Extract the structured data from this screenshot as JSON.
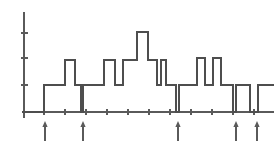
{
  "figure": {
    "title": "",
    "background_color": "#ffffff",
    "line_color": "#4e4e4e",
    "axis_color": "#5a5a5a",
    "marker_color": "#5a5a5a",
    "width": 277,
    "height": 146
  },
  "chart_data": {
    "type": "line",
    "subtype": "step",
    "title": "",
    "xlabel": "",
    "ylabel": "",
    "grid": false,
    "legend": null,
    "annotations": "Five upward arrow markers below the baseline indicate change points / segment boundaries",
    "axis": {
      "x_axis_pixel_y": 112,
      "x_axis_pixel_x_start": 22,
      "x_axis_pixel_x_end": 274,
      "y_axis_pixel_x": 24,
      "y_axis_pixel_y_top": 12,
      "y_axis_pixel_y_bottom": 118,
      "x_ticks_pixels": [
        44,
        65,
        86,
        107,
        128,
        149,
        170,
        191,
        212,
        233,
        254
      ],
      "y_ticks_pixels": [
        33,
        58,
        85
      ],
      "x_tick_labels": [],
      "y_tick_labels": [],
      "xlim": [
        0,
        11
      ],
      "ylim": [
        0,
        5
      ]
    },
    "levels_note": "Piecewise-constant signal measured in axis units; level 0 = baseline, level 4.2 = tall central peak",
    "x": [
      1.0,
      2.0,
      2.45,
      3.0,
      3.3,
      3.5,
      4.0,
      4.5,
      5.0,
      5.5,
      6.0,
      6.5,
      7.0,
      7.3,
      7.5,
      8.0,
      8.3,
      8.5,
      9.0,
      9.5,
      10.0,
      10.5,
      11.0,
      11.5,
      12.0
    ],
    "segments": [
      {
        "x_start": 22,
        "x_end": 44,
        "level_px": 112,
        "value": 0.0
      },
      {
        "x_start": 44,
        "x_end": 65,
        "level_px": 85,
        "value": 1.3
      },
      {
        "x_start": 65,
        "x_end": 75,
        "level_px": 60,
        "value": 2.5
      },
      {
        "x_start": 75,
        "x_end": 81,
        "level_px": 85,
        "value": 1.3
      },
      {
        "x_start": 81,
        "x_end": 83,
        "level_px": 112,
        "value": 0.0
      },
      {
        "x_start": 83,
        "x_end": 104,
        "level_px": 85,
        "value": 1.3
      },
      {
        "x_start": 104,
        "x_end": 115,
        "level_px": 60,
        "value": 2.5
      },
      {
        "x_start": 115,
        "x_end": 123,
        "level_px": 85,
        "value": 1.3
      },
      {
        "x_start": 123,
        "x_end": 137,
        "level_px": 60,
        "value": 2.5
      },
      {
        "x_start": 137,
        "x_end": 148,
        "level_px": 32,
        "value": 4.2
      },
      {
        "x_start": 148,
        "x_end": 157,
        "level_px": 60,
        "value": 2.5
      },
      {
        "x_start": 157,
        "x_end": 161,
        "level_px": 85,
        "value": 1.3
      },
      {
        "x_start": 161,
        "x_end": 166,
        "level_px": 60,
        "value": 2.5
      },
      {
        "x_start": 166,
        "x_end": 176,
        "level_px": 85,
        "value": 1.3
      },
      {
        "x_start": 176,
        "x_end": 179,
        "level_px": 112,
        "value": 0.0
      },
      {
        "x_start": 179,
        "x_end": 197,
        "level_px": 85,
        "value": 1.3
      },
      {
        "x_start": 197,
        "x_end": 205,
        "level_px": 58,
        "value": 2.6
      },
      {
        "x_start": 205,
        "x_end": 213,
        "level_px": 85,
        "value": 1.3
      },
      {
        "x_start": 213,
        "x_end": 221,
        "level_px": 58,
        "value": 2.6
      },
      {
        "x_start": 221,
        "x_end": 233,
        "level_px": 85,
        "value": 1.3
      },
      {
        "x_start": 233,
        "x_end": 236,
        "level_px": 112,
        "value": 0.0
      },
      {
        "x_start": 236,
        "x_end": 250,
        "level_px": 85,
        "value": 1.3
      },
      {
        "x_start": 250,
        "x_end": 258,
        "level_px": 112,
        "value": 0.0
      },
      {
        "x_start": 258,
        "x_end": 274,
        "level_px": 85,
        "value": 1.3
      }
    ],
    "change_point_markers": [
      {
        "id": "marker-1",
        "x_pixel": 45,
        "value": 1
      },
      {
        "id": "marker-2",
        "x_pixel": 83,
        "value": 2
      },
      {
        "id": "marker-3",
        "x_pixel": 178,
        "value": 3
      },
      {
        "id": "marker-4",
        "x_pixel": 236,
        "value": 4
      },
      {
        "id": "marker-5",
        "x_pixel": 257,
        "value": 5
      }
    ]
  }
}
